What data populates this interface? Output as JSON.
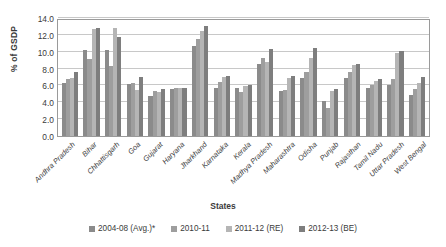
{
  "chart_data": {
    "type": "bar",
    "title": "",
    "xlabel": "States",
    "ylabel": "% of GSDP",
    "ylim": [
      0.0,
      14.0
    ],
    "ytick_labels": [
      "0.0",
      "2.0",
      "4.0",
      "6.0",
      "8.0",
      "10.0",
      "12.0",
      "14.0"
    ],
    "ytick_values": [
      0.0,
      2.0,
      4.0,
      6.0,
      8.0,
      10.0,
      12.0,
      14.0
    ],
    "grid": true,
    "legend_position": "bottom",
    "categories": [
      "Andhra Pradesh",
      "Bihar",
      "Chhattisgarh",
      "Goa",
      "Gujarat",
      "Haryana",
      "Jharkhand",
      "Karnataka",
      "Kerala",
      "Madhya Pradesh",
      "Maharashtra",
      "Odisha",
      "Punjab",
      "Rajasthan",
      "Tamil Nadu",
      "Uttar Pradesh",
      "West Bengal"
    ],
    "series": [
      {
        "name": "2004-08 (Avg.)*",
        "color": "#8b8b8b",
        "values": [
          6.3,
          10.2,
          10.2,
          6.2,
          4.7,
          5.6,
          10.7,
          5.7,
          5.7,
          8.6,
          5.3,
          6.9,
          4.1,
          6.9,
          5.7,
          6.1,
          4.9
        ]
      },
      {
        "name": "2010-11",
        "color": "#9e9e9e",
        "values": [
          6.8,
          9.1,
          8.3,
          6.3,
          5.3,
          5.7,
          11.5,
          6.4,
          5.2,
          9.2,
          5.5,
          7.6,
          3.3,
          7.6,
          6.1,
          6.8,
          5.6
        ]
      },
      {
        "name": "2011-12 (RE)",
        "color": "#b5b5b5",
        "values": [
          6.9,
          12.7,
          12.8,
          5.5,
          5.2,
          5.7,
          12.5,
          7.0,
          5.9,
          8.8,
          6.9,
          9.3,
          5.4,
          8.4,
          6.5,
          9.9,
          6.3
        ]
      },
      {
        "name": "2012-13 (BE)",
        "color": "#7e7e7e",
        "values": [
          7.6,
          12.8,
          11.7,
          7.0,
          5.6,
          5.7,
          13.1,
          7.1,
          6.0,
          10.3,
          7.1,
          10.4,
          5.6,
          8.6,
          6.8,
          10.1,
          7.0
        ]
      }
    ]
  }
}
